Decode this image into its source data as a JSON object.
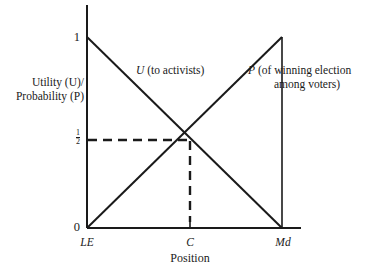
{
  "figure": {
    "background": "#ffffff",
    "ink": "#1a1a1a"
  },
  "axes": {
    "y_title_line1": "Utility (U)/",
    "y_title_line2": "Probability (P)",
    "y_title_plain": "Utility (U)/ Probability (P)",
    "x_title": "Position",
    "y_ticks": [
      "1",
      "½",
      "0"
    ],
    "y_tick_top": "1",
    "y_tick_mid_num": "1",
    "y_tick_mid_den": "2",
    "y_tick_bottom": "0",
    "x_ticks": [
      "LE",
      "C",
      "Md"
    ],
    "x_tick_le": "LE",
    "x_tick_c": "C",
    "x_tick_md": "Md"
  },
  "annotations": {
    "u_label": "U  (to activists)",
    "u_symbol": "U",
    "u_text": "(to activists)",
    "p_symbol": "P",
    "p_line1": "P  (of winning election",
    "p_line2": "among voters)"
  },
  "chart_data": {
    "type": "line",
    "title": "",
    "subtitle": "",
    "xlabel": "Position",
    "ylabel": "Utility (U)/ Probability (P)",
    "xlim": [
      0,
      1
    ],
    "ylim": [
      0,
      1
    ],
    "grid": false,
    "legend_position": "inline-annotations",
    "x_categories": [
      "LE",
      "C",
      "Md"
    ],
    "x_category_positions": [
      0,
      0.5,
      1
    ],
    "y_tick_values": [
      0,
      0.5,
      1
    ],
    "y_tick_labels": [
      "0",
      "½",
      "1"
    ],
    "series": [
      {
        "name": "U (to activists)",
        "x": [
          0,
          0.5,
          1
        ],
        "values": [
          1,
          0.5,
          0
        ],
        "style": "solid",
        "color": "#1a1a1a"
      },
      {
        "name": "P (of winning election among voters)",
        "x": [
          0,
          0.5,
          1
        ],
        "values": [
          0,
          0.5,
          1
        ],
        "style": "solid",
        "color": "#1a1a1a"
      }
    ],
    "guides": [
      {
        "name": "half-level-guide",
        "type": "horizontal-dashed",
        "y": 0.5,
        "x_from": 0,
        "x_to": 0.5
      },
      {
        "name": "center-position-guide",
        "type": "vertical-dashed",
        "x": 0.5,
        "y_from": 0,
        "y_to": 0.5
      },
      {
        "name": "md-boundary-line",
        "type": "vertical-solid",
        "x": 1,
        "y_from": 0,
        "y_to": 1
      }
    ],
    "intersection": {
      "x": 0.5,
      "y": 0.5,
      "x_label": "C",
      "y_label": "½"
    }
  }
}
